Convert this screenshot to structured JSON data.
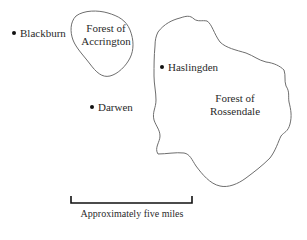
{
  "map": {
    "areas": [
      {
        "name": "Forest of Accrington",
        "line1": "Forest of",
        "line2": "Accrington"
      },
      {
        "name": "Forest of Rossendale",
        "line1": "Forest of",
        "line2": "Rossendale"
      }
    ],
    "towns": [
      {
        "name": "Blackburn"
      },
      {
        "name": "Haslingden"
      },
      {
        "name": "Darwen"
      }
    ],
    "scale": {
      "label": "Approximately five miles"
    },
    "colors": {
      "outline": "#6e6e6e",
      "scalebar": "#111111",
      "text": "#2a2a2a"
    }
  }
}
